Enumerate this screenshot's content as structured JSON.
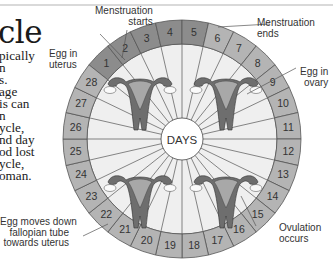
{
  "title": "cle",
  "body_lines": [
    "pically",
    "n",
    "s.",
    "age",
    "is can",
    "n",
    "ycle,",
    "nd day",
    "od lost",
    "ycle,",
    "oman."
  ],
  "center_label": "DAYS",
  "days": [
    "1",
    "2",
    "3",
    "4",
    "5",
    "6",
    "7",
    "8",
    "9",
    "10",
    "11",
    "12",
    "13",
    "14",
    "15",
    "16",
    "17",
    "18",
    "19",
    "20",
    "21",
    "22",
    "23",
    "24",
    "25",
    "26",
    "27",
    "28"
  ],
  "labels": {
    "menstruation_starts": [
      "Menstruation",
      "starts"
    ],
    "menstruation_ends": [
      "Menstruation",
      "ends"
    ],
    "egg_in_uterus": [
      "Egg in",
      "uterus"
    ],
    "egg_in_ovary": [
      "Egg in",
      "ovary"
    ],
    "egg_moves_down": [
      "Egg moves down",
      "fallopian tube",
      "towards uterus"
    ],
    "ovulation_occurs": [
      "Ovulation",
      "occurs"
    ]
  },
  "colors": {
    "menstruation_segment": "#8c8c8c",
    "cycle_segment": "#b4b4b4",
    "inner_area": "#efefef",
    "uterus_dark": "#6e6e6e",
    "uterus_light": "#a8a8a8"
  }
}
